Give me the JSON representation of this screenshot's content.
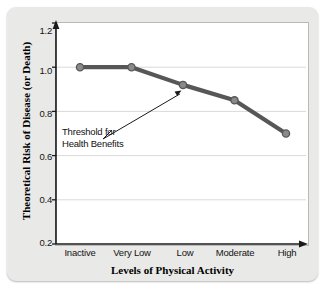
{
  "chart_data": {
    "type": "line",
    "title": "",
    "xlabel": "Levels of Physical Activity",
    "ylabel": "Theoretical Risk of Disease (or Death)",
    "categories": [
      "Inactive",
      "Very Low",
      "Low",
      "Moderate",
      "High"
    ],
    "values": [
      1.0,
      1.0,
      0.92,
      0.85,
      0.7
    ],
    "ylim": [
      0.2,
      1.2
    ],
    "yticks": [
      "0.2",
      "0.4",
      "0.6",
      "0.8",
      "1.0",
      "1.2"
    ],
    "ytick_values": [
      0.2,
      0.4,
      0.6,
      0.8,
      1.0,
      1.2
    ],
    "grid": "horizontal",
    "legend": "none",
    "series_color": "#575757",
    "marker_color": "#8a8a8a",
    "gridline_color": "#d9d9d9",
    "annotations": [
      {
        "text_line1": "Threshold for",
        "text_line2": "Health Benefits",
        "points_to_category": "Low",
        "points_to_value": 0.92
      }
    ]
  },
  "figure": {
    "card_color": "#e9e9e7",
    "plot_background": "#ffffff",
    "axis_color": "#1a1a1a"
  }
}
